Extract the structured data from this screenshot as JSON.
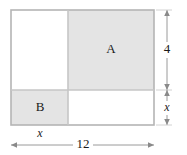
{
  "figure": {
    "type": "geometry-diagram",
    "colors": {
      "shading": "#e4e4e4",
      "outline": "#b0b0b0",
      "divider": "#c8c8c8",
      "dimension_line": "#8a8a8a",
      "text": "#1a1a1a",
      "background": "#ffffff"
    },
    "regions": [
      {
        "id": "region-top-left",
        "label": "",
        "shaded": false,
        "x": 11,
        "y": 10,
        "width": 57,
        "height": 80
      },
      {
        "id": "region-a",
        "label": "A",
        "shaded": true,
        "x": 68,
        "y": 10,
        "width": 86,
        "height": 80
      },
      {
        "id": "region-b",
        "label": "B",
        "shaded": true,
        "x": 11,
        "y": 90,
        "width": 57,
        "height": 35
      },
      {
        "id": "region-bottom-right",
        "label": "",
        "shaded": false,
        "x": 68,
        "y": 90,
        "width": 86,
        "height": 35
      }
    ],
    "labels": {
      "region_a": "A",
      "region_b": "B"
    },
    "dimensions": [
      {
        "id": "dim-height-4",
        "label": "4",
        "orientation": "vertical",
        "side": "right",
        "from": 10,
        "to": 90
      },
      {
        "id": "dim-height-x",
        "label": "x",
        "orientation": "vertical",
        "side": "right",
        "from": 90,
        "to": 125
      },
      {
        "id": "dim-width-x",
        "label": "x",
        "orientation": "horizontal",
        "side": "bottom",
        "from": 11,
        "to": 68
      },
      {
        "id": "dim-width-12",
        "label": "12",
        "orientation": "horizontal",
        "side": "bottom",
        "from": 11,
        "to": 154
      }
    ]
  }
}
